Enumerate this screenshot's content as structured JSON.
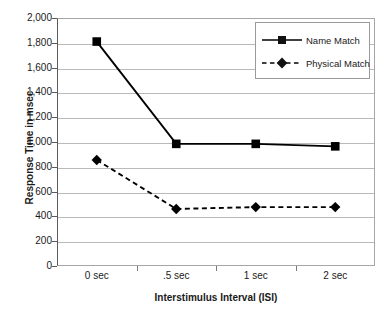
{
  "chart_data": {
    "type": "line",
    "title": "",
    "xlabel": "Interstimulus Interval (ISI)",
    "ylabel": "Response Time in msec",
    "categories": [
      "0 sec",
      ".5 sec",
      "1 sec",
      "2 sec"
    ],
    "series": [
      {
        "name": "Name Match",
        "values": [
          1810,
          985,
          985,
          965
        ],
        "line_style": "solid",
        "marker": "square",
        "color": "#000000"
      },
      {
        "name": "Physical Match",
        "values": [
          855,
          460,
          475,
          475
        ],
        "line_style": "dashed",
        "marker": "diamond",
        "color": "#000000"
      }
    ],
    "ylim": [
      0,
      2000
    ],
    "ytick_labels": [
      "0",
      "200",
      "400",
      "600",
      "800",
      "1,000",
      "1,200",
      "1,400",
      "1,600",
      "1,800",
      "2,000"
    ],
    "ytick_values": [
      0,
      200,
      400,
      600,
      800,
      1000,
      1200,
      1400,
      1600,
      1800,
      2000
    ],
    "grid": true,
    "grid_axis": "y",
    "legend_position": "top-right",
    "legend_border": true,
    "plot_border_color": "#a6a6a6",
    "gridline_color": "#b9b9b9",
    "background": "#ffffff"
  },
  "legend": {
    "entries": [
      {
        "label": "Name Match"
      },
      {
        "label": "Physical Match"
      }
    ]
  }
}
